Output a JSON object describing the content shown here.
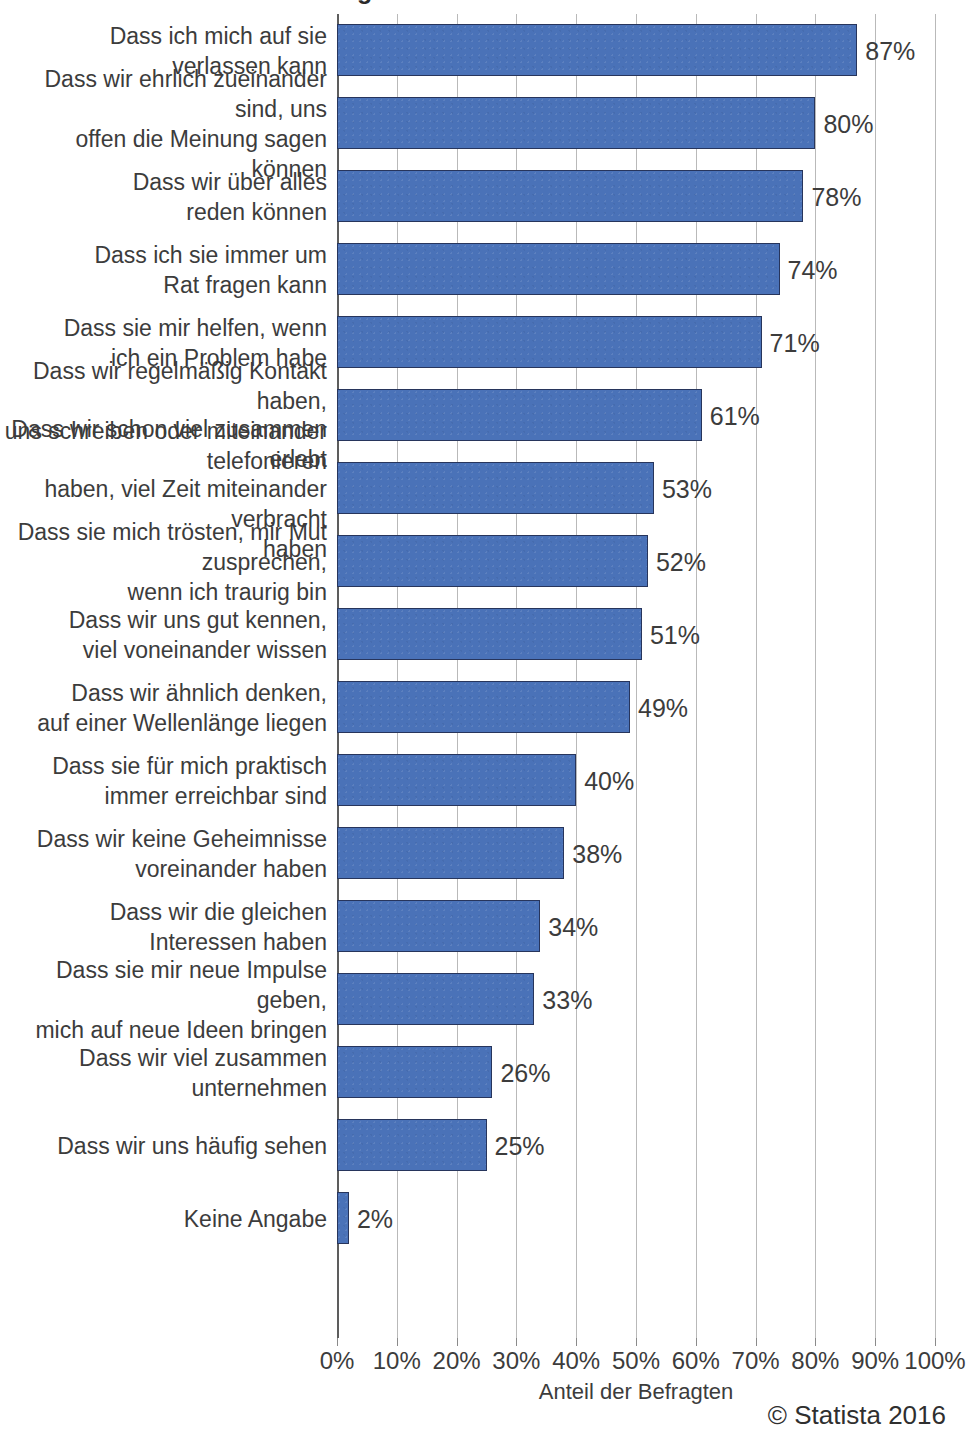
{
  "title_remnant": "Was erwarten Sie von einem guten Freund?",
  "credit": "© Statista 2016",
  "axis": {
    "xlabel": "Anteil der Befragten",
    "ticks": [
      "0%",
      "10%",
      "20%",
      "30%",
      "40%",
      "50%",
      "60%",
      "70%",
      "80%",
      "90%",
      "100%"
    ]
  },
  "colors": {
    "bar_fill": "#4a72b8",
    "bar_border": "#27355c",
    "gridline": "#b9b9b9",
    "axis": "#5d5d5d",
    "text": "#3c3c3c"
  },
  "chart_data": {
    "type": "bar",
    "orientation": "horizontal",
    "title": "Was erwarten Sie von einem guten Freund?",
    "xlabel": "Anteil der Befragten",
    "ylabel": "",
    "xlim": [
      0,
      100
    ],
    "xticks": [
      0,
      10,
      20,
      30,
      40,
      50,
      60,
      70,
      80,
      90,
      100
    ],
    "grid": true,
    "legend": false,
    "unit": "%",
    "source_note": "© Statista 2016",
    "categories": [
      "Dass ich mich auf sie\nverlassen kann",
      "Dass wir ehrlich zueinander sind, uns\noffen die Meinung sagen können",
      "Dass wir über alles\nreden können",
      "Dass ich sie immer um\nRat fragen kann",
      "Dass sie mir helfen, wenn\nich ein Problem habe",
      "Dass wir regelmäßig Kontakt haben,\nuns schreiben oder miteinander\ntelefonieren",
      "Dass wir schon viel zusammen erlebt\nhaben, viel Zeit miteinander verbracht\nhaben",
      "Dass sie mich trösten, mir Mut\nzusprechen,\nwenn ich traurig bin",
      "Dass wir uns gut kennen,\nviel voneinander wissen",
      "Dass wir ähnlich denken,\nauf einer Wellenlänge liegen",
      "Dass sie für mich praktisch\nimmer erreichbar sind",
      "Dass wir keine Geheimnisse\nvoreinander haben",
      "Dass wir die gleichen\nInteressen haben",
      "Dass sie mir neue Impulse geben,\nmich auf neue Ideen bringen",
      "Dass wir viel zusammen\nunternehmen",
      "Dass wir uns häufig sehen",
      "Keine Angabe"
    ],
    "values": [
      87,
      80,
      78,
      74,
      71,
      61,
      53,
      52,
      51,
      49,
      40,
      38,
      34,
      33,
      26,
      25,
      2
    ],
    "value_labels": [
      "87%",
      "80%",
      "78%",
      "74%",
      "71%",
      "61%",
      "53%",
      "52%",
      "51%",
      "49%",
      "40%",
      "38%",
      "34%",
      "33%",
      "26%",
      "25%",
      "2%"
    ]
  }
}
